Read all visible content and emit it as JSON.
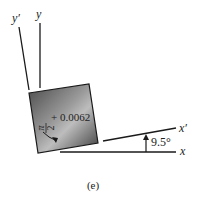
{
  "diagram": {
    "caption": "(e)",
    "axes": {
      "x": "x",
      "y": "y",
      "x_prime": "x′",
      "y_prime": "y′"
    },
    "rotation_angle_label": "9.5°",
    "element": {
      "angle_label_fraction_num": "π",
      "angle_label_fraction_den": "2",
      "angle_label_term": "+ 0.0062"
    },
    "colors": {
      "line": "#1a1a1a",
      "element_dark": "#3a3a3a",
      "element_light": "#c8c8c8"
    }
  }
}
